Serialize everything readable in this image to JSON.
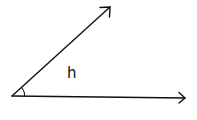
{
  "diagram": {
    "type": "angle",
    "angle_label": "h",
    "vertex": {
      "x": 12,
      "y": 96
    },
    "rays": [
      {
        "name": "upper-ray",
        "from": {
          "x": 12,
          "y": 96
        },
        "to": {
          "x": 110,
          "y": 7
        }
      },
      {
        "name": "lower-ray",
        "from": {
          "x": 12,
          "y": 96
        },
        "to": {
          "x": 185,
          "y": 98
        }
      }
    ],
    "colors": {
      "stroke": "#111111",
      "background": "#ffffff"
    }
  }
}
